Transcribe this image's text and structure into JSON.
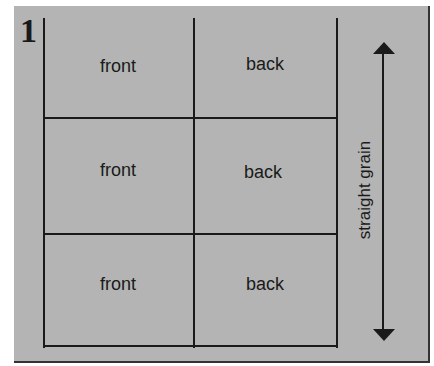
{
  "figure": {
    "number": "1",
    "background_color": "#b4b4b4",
    "line_color": "#1a1a1a"
  },
  "grid": {
    "rows": [
      {
        "left": "front",
        "right": "back"
      },
      {
        "left": "front",
        "right": "back"
      },
      {
        "left": "front",
        "right": "back"
      }
    ]
  },
  "grain": {
    "label": "straight grain",
    "icon": "double-headed-vertical-arrow"
  }
}
